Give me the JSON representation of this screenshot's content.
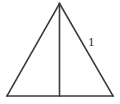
{
  "figure": {
    "name": "isosceles-triangle-with-altitude",
    "background_color": "#ffffff",
    "stroke_color": "#3a3a3a",
    "label_color": "#2e2e2e",
    "stroke_width": 1.6,
    "vertices": {
      "apex": {
        "x": 59.5,
        "y": 3.5
      },
      "bottom_left": {
        "x": 7,
        "y": 96
      },
      "bottom_right": {
        "x": 113,
        "y": 96
      }
    },
    "altitude": {
      "from": {
        "x": 59.5,
        "y": 3.5
      },
      "to": {
        "x": 59.5,
        "y": 96
      }
    },
    "edges": [
      {
        "name": "left-side",
        "from": "apex",
        "to": "bottom_left"
      },
      {
        "name": "right-side",
        "from": "apex",
        "to": "bottom_right"
      },
      {
        "name": "base",
        "from": "bottom_left",
        "to": "bottom_right"
      }
    ],
    "labels": [
      {
        "name": "right-side-length",
        "text": "1",
        "x": 88,
        "y": 46,
        "target_edge": "right-side"
      }
    ]
  }
}
